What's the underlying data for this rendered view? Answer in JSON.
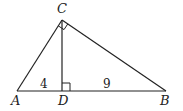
{
  "diagram": {
    "type": "right-triangle-with-altitude",
    "stroke_color": "#222222",
    "points": {
      "A": {
        "label": "A",
        "x": 17,
        "y": 91
      },
      "B": {
        "label": "B",
        "x": 166,
        "y": 91
      },
      "C": {
        "label": "C",
        "x": 62,
        "y": 20
      },
      "D": {
        "label": "D",
        "x": 62,
        "y": 91
      }
    },
    "segments": [
      {
        "from": "A",
        "to": "B"
      },
      {
        "from": "A",
        "to": "C"
      },
      {
        "from": "C",
        "to": "B"
      },
      {
        "from": "C",
        "to": "D"
      }
    ],
    "right_angles": [
      "C",
      "D"
    ],
    "measurements": {
      "AD": "4",
      "DB": "9"
    }
  }
}
